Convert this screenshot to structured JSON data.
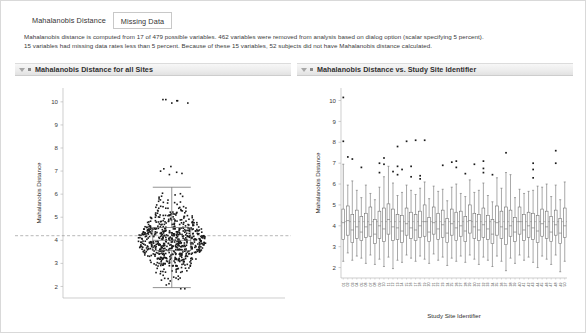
{
  "tabs": [
    {
      "label": "Mahalanobis Distance",
      "active": true
    },
    {
      "label": "Missing Data",
      "active": false
    }
  ],
  "description": {
    "line1": "Mahalanobis distance is computed from 17 of 479 possible variables. 462 variables were removed from analysis based on dialog option (scalar specifying 5 percent).",
    "line2": "15 variables had missing data rates less than 5 percent. Because of these 15 variables, 52 subjects did not have Mahalanobis distance calculated."
  },
  "panels": {
    "left": {
      "title": "Mahalanobis Distance for all Sites"
    },
    "right": {
      "title": "Mahalanobis Distance vs. Study Site Identifier"
    }
  },
  "colors": {
    "point": "#1a1a1a",
    "box_stroke": "#6e6e6e",
    "reference_line": "#9a9a9a",
    "axis": "#b9b9b9",
    "panel_header_text": "#2f2f2f"
  },
  "chart_data": [
    {
      "type": "scatter",
      "id": "mahalanobis-all-sites",
      "title": "Mahalanobis Distance for all Sites",
      "xlabel": "",
      "ylabel": "Mahalanobis Distance",
      "ylim": [
        1.5,
        10.6
      ],
      "yticks": [
        2,
        3,
        4,
        5,
        6,
        7,
        8,
        9,
        10
      ],
      "grid": false,
      "jitter": true,
      "reference_line": {
        "y": 4.2,
        "style": "dashed",
        "label": ""
      },
      "box": {
        "q1": 3.55,
        "median": 4.0,
        "q3": 4.55,
        "whisker_low": 1.95,
        "whisker_high": 6.3
      },
      "n_points": 690,
      "values_summary": {
        "min": 1.9,
        "max": 10.1,
        "median": 4.0,
        "outliers_high": [
          10.1,
          10.05,
          9.95,
          7.2,
          7.1,
          7.0,
          6.95,
          6.9,
          6.85
        ]
      }
    },
    {
      "type": "boxplot",
      "id": "mahalanobis-by-site",
      "title": "Mahalanobis Distance vs. Study Site Identifier",
      "xlabel": "Study Site Identifier",
      "ylabel": "Mahalanobis Distance",
      "ylim": [
        1.5,
        10.6
      ],
      "yticks": [
        2,
        3,
        4,
        5,
        6,
        7,
        8,
        9,
        10
      ],
      "grid": false,
      "reference_line": {
        "y": 4.2,
        "style": "solid"
      },
      "categories": [
        "01",
        "02",
        "03",
        "04",
        "05",
        "06",
        "07",
        "08",
        "09",
        "10",
        "11",
        "12",
        "13",
        "14",
        "15",
        "16",
        "17",
        "18",
        "19",
        "20",
        "21",
        "22",
        "23",
        "24",
        "25",
        "26",
        "27",
        "28",
        "29",
        "30",
        "31",
        "32",
        "33",
        "34",
        "35",
        "36",
        "37",
        "38",
        "39",
        "40",
        "41",
        "42",
        "43",
        "44",
        "45",
        "46",
        "47",
        "48",
        "49",
        "50"
      ],
      "boxes": [
        {
          "site": "01",
          "whisker_low": 2.3,
          "q1": 3.35,
          "median": 4.15,
          "q3": 4.8,
          "whisker_high": 6.95,
          "outliers": [
            8.05,
            10.15
          ]
        },
        {
          "site": "02",
          "whisker_low": 2.7,
          "q1": 3.55,
          "median": 4.25,
          "q3": 4.95,
          "whisker_high": 5.95,
          "outliers": [
            7.3
          ]
        },
        {
          "site": "03",
          "whisker_low": 2.35,
          "q1": 3.2,
          "median": 3.8,
          "q3": 4.55,
          "whisker_high": 6.15,
          "outliers": [
            7.2
          ]
        },
        {
          "site": "04",
          "whisker_low": 2.55,
          "q1": 3.4,
          "median": 3.95,
          "q3": 4.75,
          "whisker_high": 5.7,
          "outliers": []
        },
        {
          "site": "05",
          "whisker_low": 2.45,
          "q1": 3.3,
          "median": 3.7,
          "q3": 4.45,
          "whisker_high": 5.35,
          "outliers": [
            6.8
          ]
        },
        {
          "site": "06",
          "whisker_low": 2.2,
          "q1": 3.45,
          "median": 3.95,
          "q3": 4.6,
          "whisker_high": 5.95,
          "outliers": []
        },
        {
          "site": "07",
          "whisker_low": 2.6,
          "q1": 3.5,
          "median": 4.05,
          "q3": 4.9,
          "whisker_high": 5.55,
          "outliers": []
        },
        {
          "site": "08",
          "whisker_low": 2.15,
          "q1": 3.15,
          "median": 3.6,
          "q3": 4.3,
          "whisker_high": 5.25,
          "outliers": []
        },
        {
          "site": "09",
          "whisker_low": 2.4,
          "q1": 3.4,
          "median": 4.0,
          "q3": 4.7,
          "whisker_high": 5.85,
          "outliers": [
            6.55,
            7.0
          ]
        },
        {
          "site": "10",
          "whisker_low": 2.05,
          "q1": 3.25,
          "median": 3.85,
          "q3": 4.85,
          "whisker_high": 6.35,
          "outliers": [
            6.95,
            7.25
          ]
        },
        {
          "site": "11",
          "whisker_low": 2.5,
          "q1": 3.6,
          "median": 4.3,
          "q3": 5.05,
          "whisker_high": 6.85,
          "outliers": []
        },
        {
          "site": "12",
          "whisker_low": 1.95,
          "q1": 3.3,
          "median": 3.95,
          "q3": 4.8,
          "whisker_high": 6.05,
          "outliers": [
            6.6
          ]
        },
        {
          "site": "13",
          "whisker_low": 2.35,
          "q1": 3.35,
          "median": 3.9,
          "q3": 4.55,
          "whisker_high": 5.45,
          "outliers": [
            6.45,
            6.85,
            7.8
          ]
        },
        {
          "site": "14",
          "whisker_low": 2.25,
          "q1": 3.2,
          "median": 3.75,
          "q3": 4.5,
          "whisker_high": 5.6,
          "outliers": [
            6.7
          ]
        },
        {
          "site": "15",
          "whisker_low": 2.6,
          "q1": 3.55,
          "median": 4.1,
          "q3": 4.85,
          "whisker_high": 5.95,
          "outliers": [
            8.05
          ]
        },
        {
          "site": "16",
          "whisker_low": 2.45,
          "q1": 3.4,
          "median": 3.9,
          "q3": 4.65,
          "whisker_high": 5.7,
          "outliers": [
            6.35,
            6.85
          ]
        },
        {
          "site": "17",
          "whisker_low": 2.3,
          "q1": 3.3,
          "median": 3.8,
          "q3": 4.55,
          "whisker_high": 5.5,
          "outliers": [
            8.1
          ]
        },
        {
          "site": "18",
          "whisker_low": 2.55,
          "q1": 3.45,
          "median": 4.0,
          "q3": 4.7,
          "whisker_high": 5.8,
          "outliers": [
            6.25,
            6.4
          ]
        },
        {
          "site": "19",
          "whisker_low": 2.4,
          "q1": 3.5,
          "median": 4.2,
          "q3": 5.0,
          "whisker_high": 6.1,
          "outliers": [
            8.1
          ]
        },
        {
          "site": "20",
          "whisker_low": 2.2,
          "q1": 3.25,
          "median": 3.7,
          "q3": 4.4,
          "whisker_high": 5.3,
          "outliers": []
        },
        {
          "site": "21",
          "whisker_low": 2.65,
          "q1": 3.6,
          "median": 4.15,
          "q3": 4.9,
          "whisker_high": 5.9,
          "outliers": []
        },
        {
          "site": "22",
          "whisker_low": 2.35,
          "q1": 3.35,
          "median": 3.85,
          "q3": 4.6,
          "whisker_high": 5.65,
          "outliers": []
        },
        {
          "site": "23",
          "whisker_low": 2.5,
          "q1": 3.45,
          "median": 4.05,
          "q3": 4.75,
          "whisker_high": 5.75,
          "outliers": [
            6.9
          ]
        },
        {
          "site": "24",
          "whisker_low": 2.1,
          "q1": 3.2,
          "median": 3.65,
          "q3": 4.35,
          "whisker_high": 5.2,
          "outliers": []
        },
        {
          "site": "25",
          "whisker_low": 2.45,
          "q1": 3.55,
          "median": 4.1,
          "q3": 4.8,
          "whisker_high": 5.85,
          "outliers": [
            7.05
          ]
        },
        {
          "site": "26",
          "whisker_low": 2.3,
          "q1": 3.3,
          "median": 3.9,
          "q3": 4.65,
          "whisker_high": 6.0,
          "outliers": [
            6.8,
            7.1
          ]
        },
        {
          "site": "27",
          "whisker_low": 2.55,
          "q1": 3.5,
          "median": 4.0,
          "q3": 4.7,
          "whisker_high": 5.55,
          "outliers": []
        },
        {
          "site": "28",
          "whisker_low": 2.25,
          "q1": 3.25,
          "median": 3.75,
          "q3": 4.45,
          "whisker_high": 5.4,
          "outliers": [
            6.5
          ]
        },
        {
          "site": "29",
          "whisker_low": 2.6,
          "q1": 3.65,
          "median": 4.25,
          "q3": 5.0,
          "whisker_high": 6.2,
          "outliers": []
        },
        {
          "site": "30",
          "whisker_low": 2.4,
          "q1": 3.4,
          "median": 3.95,
          "q3": 4.6,
          "whisker_high": 5.6,
          "outliers": [
            6.95
          ]
        },
        {
          "site": "31",
          "whisker_low": 2.15,
          "q1": 3.3,
          "median": 3.8,
          "q3": 4.55,
          "whisker_high": 5.7,
          "outliers": []
        },
        {
          "site": "32",
          "whisker_low": 2.5,
          "q1": 3.45,
          "median": 4.05,
          "q3": 4.85,
          "whisker_high": 6.05,
          "outliers": [
            6.55,
            6.75,
            7.1
          ]
        },
        {
          "site": "33",
          "whisker_low": 2.35,
          "q1": 3.35,
          "median": 3.85,
          "q3": 4.5,
          "whisker_high": 5.45,
          "outliers": []
        },
        {
          "site": "34",
          "whisker_low": 2.05,
          "q1": 3.15,
          "median": 3.6,
          "q3": 4.3,
          "whisker_high": 5.15,
          "outliers": [
            6.45
          ]
        },
        {
          "site": "35",
          "whisker_low": 2.55,
          "q1": 3.55,
          "median": 4.15,
          "q3": 4.95,
          "whisker_high": 6.3,
          "outliers": []
        },
        {
          "site": "36",
          "whisker_low": 2.3,
          "q1": 3.4,
          "median": 3.95,
          "q3": 4.7,
          "whisker_high": 5.8,
          "outliers": []
        },
        {
          "site": "37",
          "whisker_low": 1.85,
          "q1": 3.1,
          "median": 3.85,
          "q3": 4.9,
          "whisker_high": 6.55,
          "outliers": [
            7.5
          ]
        },
        {
          "site": "38",
          "whisker_low": 2.45,
          "q1": 3.5,
          "median": 4.0,
          "q3": 4.75,
          "whisker_high": 6.45,
          "outliers": []
        },
        {
          "site": "39",
          "whisker_low": 2.2,
          "q1": 3.25,
          "median": 3.7,
          "q3": 4.4,
          "whisker_high": 5.35,
          "outliers": []
        },
        {
          "site": "40",
          "whisker_low": 2.6,
          "q1": 3.6,
          "median": 4.2,
          "q3": 4.9,
          "whisker_high": 5.75,
          "outliers": []
        },
        {
          "site": "41",
          "whisker_low": 2.35,
          "q1": 3.3,
          "median": 3.8,
          "q3": 4.55,
          "whisker_high": 5.55,
          "outliers": []
        },
        {
          "site": "42",
          "whisker_low": 2.5,
          "q1": 3.45,
          "median": 4.0,
          "q3": 4.65,
          "whisker_high": 5.65,
          "outliers": []
        },
        {
          "site": "43",
          "whisker_low": 2.25,
          "q1": 3.35,
          "median": 3.9,
          "q3": 4.6,
          "whisker_high": 5.7,
          "outliers": [
            6.3,
            6.7,
            7.0
          ]
        },
        {
          "site": "44",
          "whisker_low": 2.0,
          "q1": 3.2,
          "median": 3.75,
          "q3": 4.5,
          "whisker_high": 5.9,
          "outliers": []
        },
        {
          "site": "45",
          "whisker_low": 2.55,
          "q1": 3.5,
          "median": 4.1,
          "q3": 4.8,
          "whisker_high": 5.85,
          "outliers": []
        },
        {
          "site": "46",
          "whisker_low": 2.4,
          "q1": 3.4,
          "median": 3.95,
          "q3": 4.7,
          "whisker_high": 6.0,
          "outliers": []
        },
        {
          "site": "47",
          "whisker_low": 2.15,
          "q1": 3.25,
          "median": 3.7,
          "q3": 4.45,
          "whisker_high": 5.4,
          "outliers": []
        },
        {
          "site": "48",
          "whisker_low": 2.6,
          "q1": 3.55,
          "median": 4.05,
          "q3": 4.75,
          "whisker_high": 5.95,
          "outliers": [
            7.0,
            7.6
          ]
        },
        {
          "site": "49",
          "whisker_low": 1.8,
          "q1": 3.15,
          "median": 3.65,
          "q3": 4.35,
          "whisker_high": 5.25,
          "outliers": []
        },
        {
          "site": "50",
          "whisker_low": 2.3,
          "q1": 3.45,
          "median": 4.0,
          "q3": 4.85,
          "whisker_high": 6.1,
          "outliers": []
        }
      ]
    }
  ]
}
